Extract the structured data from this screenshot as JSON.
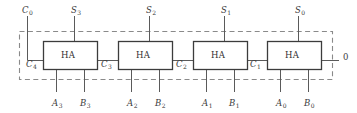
{
  "diagram": {
    "type": "logic-circuit",
    "colors": {
      "background": "#ffffff",
      "wire": "#5a5a5a",
      "box_border": "#3c3c3c",
      "dashed_border": "#8a8a8a",
      "text": "#3a3a3a"
    },
    "blocks": [
      {
        "id": "ha3",
        "label": "HA",
        "x": 43,
        "y": 41,
        "w": 54,
        "h": 28
      },
      {
        "id": "ha2",
        "label": "HA",
        "x": 118,
        "y": 41,
        "w": 54,
        "h": 28
      },
      {
        "id": "ha1",
        "label": "HA",
        "x": 193,
        "y": 41,
        "w": 54,
        "h": 28
      },
      {
        "id": "ha0",
        "label": "HA",
        "x": 267,
        "y": 41,
        "w": 54,
        "h": 28
      }
    ],
    "top_labels": [
      {
        "name": "carry-in-label",
        "base": "C",
        "sub": "0",
        "x": 22,
        "y": 6
      },
      {
        "name": "sum-label-3",
        "base": "S",
        "sub": "3",
        "x": 71,
        "y": 6
      },
      {
        "name": "sum-label-2",
        "base": "S",
        "sub": "2",
        "x": 146,
        "y": 6
      },
      {
        "name": "sum-label-1",
        "base": "S",
        "sub": "1",
        "x": 221,
        "y": 6
      },
      {
        "name": "sum-label-0",
        "base": "S",
        "sub": "0",
        "x": 295,
        "y": 6
      }
    ],
    "carry_labels": [
      {
        "name": "carry-label-4",
        "base": "C",
        "sub": "4",
        "x": 26,
        "y": 60
      },
      {
        "name": "carry-label-3",
        "base": "C",
        "sub": "3",
        "x": 101,
        "y": 60
      },
      {
        "name": "carry-label-2",
        "base": "C",
        "sub": "2",
        "x": 176,
        "y": 60
      },
      {
        "name": "carry-label-1",
        "base": "C",
        "sub": "1",
        "x": 250,
        "y": 60
      }
    ],
    "bottom_labels": [
      {
        "name": "input-label-a3",
        "base": "A",
        "sub": "3",
        "x": 52,
        "y": 99
      },
      {
        "name": "input-label-b3",
        "base": "B",
        "sub": "3",
        "x": 80,
        "y": 99
      },
      {
        "name": "input-label-a2",
        "base": "A",
        "sub": "2",
        "x": 127,
        "y": 99
      },
      {
        "name": "input-label-b2",
        "base": "B",
        "sub": "2",
        "x": 155,
        "y": 99
      },
      {
        "name": "input-label-a1",
        "base": "A",
        "sub": "1",
        "x": 202,
        "y": 99
      },
      {
        "name": "input-label-b1",
        "base": "B",
        "sub": "1",
        "x": 229,
        "y": 99
      },
      {
        "name": "input-label-a0",
        "base": "A",
        "sub": "0",
        "x": 276,
        "y": 99
      },
      {
        "name": "input-label-b0",
        "base": "B",
        "sub": "0",
        "x": 304,
        "y": 99
      }
    ],
    "output_label": {
      "name": "output-label-zero",
      "text": "0",
      "x": 343,
      "y": 53
    }
  }
}
